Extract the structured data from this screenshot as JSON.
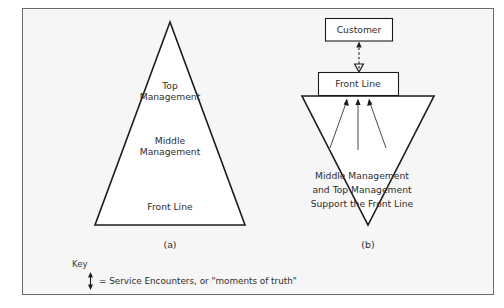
{
  "figure": {
    "background_color": "#f6f6f6",
    "border_color": "#6b6b6b",
    "outline_color": "#1c1c1c",
    "shape_fill": "#ffffff"
  },
  "panel_a": {
    "caption": "(a)",
    "levels": [
      {
        "label_line1": "Top",
        "label_line2": "Management"
      },
      {
        "label_line1": "Middle",
        "label_line2": "Management"
      },
      {
        "label_line1": "Front Line",
        "label_line2": ""
      }
    ],
    "top_label_line1": "Top",
    "top_label_line2": "Management",
    "middle_label_line1": "Middle",
    "middle_label_line2": "Management",
    "front_label": "Front Line"
  },
  "panel_b": {
    "caption": "(b)",
    "customer_box": "Customer",
    "front_line_box": "Front Line",
    "support_text_line1": "Middle Management",
    "support_text_line2": "and Top Management",
    "support_text_line3": "Support the Front Line",
    "support_arrow_count": 3
  },
  "key": {
    "title": "Key",
    "symbol": "vertical-double-arrow",
    "description": "= Service Encounters, or \"moments of truth\""
  }
}
